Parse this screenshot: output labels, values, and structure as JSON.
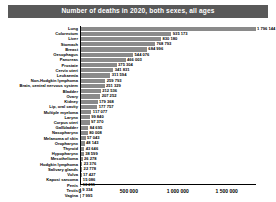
{
  "chart_data": {
    "type": "bar",
    "orientation": "horizontal",
    "title": "Number of deaths in 2020, both sexes, all ages",
    "xlabel": "",
    "ylabel": "",
    "xlim": [
      0,
      1800000
    ],
    "grid": false,
    "legend": null,
    "tick_labels": [
      "0",
      "500 000",
      "1 000 000",
      "1 500 000"
    ],
    "tick_values": [
      0,
      500000,
      1000000,
      1500000
    ],
    "categories": [
      "Lung",
      "Colorectum",
      "Liver",
      "Stomach",
      "Breast",
      "Oesophagus",
      "Pancreas",
      "Prostate",
      "Cervix uteri",
      "Leukaemia",
      "Non-Hodgkin lymphoma",
      "Brain, central nervous system",
      "Bladder",
      "Ovary",
      "Kidney",
      "Lip, oral cavity",
      "Multiple myeloma",
      "Larynx",
      "Corpus uteri",
      "Gallbladder",
      "Nasopharynx",
      "Melanoma of skin",
      "Oropharynx",
      "Thyroid",
      "Hypopharynx",
      "Mesothelioma",
      "Hodgkin lymphoma",
      "Salivary glands",
      "Vulva",
      "Kaposi sarcoma",
      "Penis",
      "Testis",
      "Vagina"
    ],
    "values": [
      1796144,
      935173,
      830180,
      768793,
      684996,
      544076,
      466003,
      375304,
      341831,
      311594,
      259793,
      251329,
      212536,
      207252,
      179368,
      177757,
      117077,
      99840,
      97370,
      84695,
      80008,
      57043,
      48143,
      43646,
      38599,
      26278,
      23376,
      22778,
      17427,
      15086,
      13211,
      9334,
      7995
    ],
    "value_labels": [
      "1 796 144",
      "935 173",
      "830 180",
      "768 793",
      "684 996",
      "544 076",
      "466 003",
      "375 304",
      "341 831",
      "311 594",
      "259 793",
      "251 329",
      "212 536",
      "207 252",
      "179 368",
      "177 757",
      "117 077",
      "99 840",
      "97 370",
      "84 695",
      "80 008",
      "57 043",
      "48 143",
      "43 646",
      "38 599",
      "26 278",
      "23 376",
      "22 778",
      "17 427",
      "15 086",
      "13 211",
      "9 334",
      "7 995"
    ],
    "colors": {
      "bar": "#8a8a8a",
      "title_background": "#595959",
      "title_text": "#ffffff",
      "axis": "#000000",
      "background": "#ffffff"
    }
  }
}
